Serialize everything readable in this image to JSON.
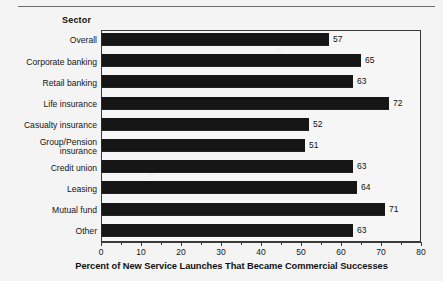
{
  "page": {
    "header_label": "Sector"
  },
  "chart_data": {
    "type": "bar",
    "orientation": "horizontal",
    "title": "",
    "subtitle": "",
    "category_axis_label": "Sector",
    "xlabel": "Percent of New Service Launches That Became Commercial Successes",
    "ylabel": "",
    "xlim": [
      0,
      80
    ],
    "xticks": [
      0,
      10,
      20,
      30,
      40,
      50,
      60,
      70,
      80
    ],
    "xtick_labels": [
      "0",
      "10",
      "20",
      "30",
      "40",
      "50",
      "60",
      "70",
      "80"
    ],
    "minor_tick_interval": 5,
    "grid": false,
    "legend": false,
    "bar_color": "#161616",
    "categories": [
      "Overall",
      "Corporate banking",
      "Retail banking",
      "Life insurance",
      "Casualty insurance",
      "Group/Pension\ninsurance",
      "Credit union",
      "Leasing",
      "Mutual fund",
      "Other"
    ],
    "values": [
      57,
      65,
      63,
      72,
      52,
      51,
      63,
      64,
      71,
      63
    ],
    "value_labels": [
      "57",
      "65",
      "63",
      "72",
      "52",
      "51",
      "63",
      "64",
      "71",
      "63"
    ]
  }
}
